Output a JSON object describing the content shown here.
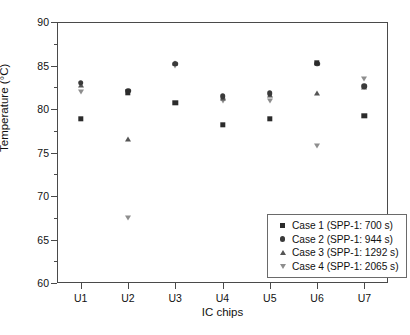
{
  "chart_data": {
    "type": "scatter",
    "title": "",
    "xlabel": "IC chips",
    "ylabel": "Temperature (°C)",
    "categories": [
      "U1",
      "U2",
      "U3",
      "U4",
      "U5",
      "U6",
      "U7"
    ],
    "ylim": [
      60,
      90
    ],
    "ytick_labels": [
      "60",
      "65",
      "70",
      "75",
      "80",
      "85",
      "90"
    ],
    "ytick_values": [
      60,
      65,
      70,
      75,
      80,
      85,
      90
    ],
    "yminor_values": [
      62.5,
      67.5,
      72.5,
      77.5,
      82.5,
      87.5
    ],
    "grid": false,
    "legend_position": "lower right (inside axes)",
    "series": [
      {
        "name": "Case 1 (SPP-1: 700 s)",
        "marker": "square",
        "color": "#2b2b2b",
        "values": [
          78.9,
          81.9,
          80.7,
          78.2,
          78.9,
          85.3,
          79.2
        ]
      },
      {
        "name": "Case 2 (SPP-1: 944 s)",
        "marker": "circle",
        "color": "#3a3a3a",
        "values": [
          83.0,
          82.1,
          85.2,
          81.5,
          81.8,
          85.2,
          82.6
        ]
      },
      {
        "name": "Case 3 (SPP-1: 1292 s)",
        "marker": "triangle-up",
        "color": "#555555",
        "values": [
          82.8,
          76.6,
          85.3,
          81.3,
          81.6,
          81.8,
          82.5
        ]
      },
      {
        "name": "Case 4 (SPP-1: 2065 s)",
        "marker": "triangle-down",
        "color": "#8e8e8e",
        "values": [
          82.0,
          67.5,
          85.0,
          80.9,
          80.9,
          75.7,
          83.5
        ]
      }
    ]
  },
  "legend": {
    "entries": [
      {
        "label": "Case 1 (SPP-1: 700 s)",
        "marker": "square"
      },
      {
        "label": "Case 2 (SPP-1: 944 s)",
        "marker": "circle"
      },
      {
        "label": "Case 3 (SPP-1: 1292 s)",
        "marker": "triangle-up"
      },
      {
        "label": "Case 4 (SPP-1: 2065 s)",
        "marker": "triangle-down"
      }
    ]
  },
  "axes": {
    "x_title": "IC chips",
    "y_title": "Temperature (°C)"
  }
}
